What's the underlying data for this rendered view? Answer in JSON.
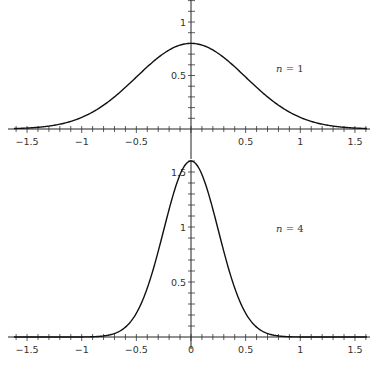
{
  "chart_data": [
    {
      "type": "line",
      "title": "",
      "annotation": "n = 1",
      "xlabel": "",
      "ylabel": "",
      "xlim": [
        -1.65,
        1.65
      ],
      "ylim": [
        0,
        1.2
      ],
      "xticks": [
        -1.5,
        -1,
        -0.5,
        0.5,
        1,
        1.5
      ],
      "xtick_labels": [
        "-1.5",
        "-1",
        "-0.5",
        "0.5",
        "1",
        "1.5"
      ],
      "yticks": [
        0.5,
        1
      ],
      "ytick_labels": [
        "0.5",
        "1"
      ],
      "grid": false,
      "series": [
        {
          "name": "n = 1",
          "function": "gaussian",
          "peak": 0.8,
          "sigma": 0.5
        }
      ]
    },
    {
      "type": "line",
      "title": "",
      "annotation": "n = 4",
      "xlabel": "",
      "ylabel": "",
      "xlim": [
        -1.65,
        1.65
      ],
      "ylim": [
        0,
        1.6
      ],
      "xticks": [
        -1.5,
        -1,
        -0.5,
        0,
        0.5,
        1,
        1.5
      ],
      "xtick_labels": [
        "-1.5",
        "-1",
        "-0.5",
        "0",
        "0.5",
        "1",
        "1.5"
      ],
      "yticks": [
        0.5,
        1,
        1.5
      ],
      "ytick_labels": [
        "0.5",
        "1",
        "1.5"
      ],
      "grid": false,
      "series": [
        {
          "name": "n = 4",
          "function": "gaussian",
          "peak": 1.6,
          "sigma": 0.25
        }
      ]
    }
  ]
}
